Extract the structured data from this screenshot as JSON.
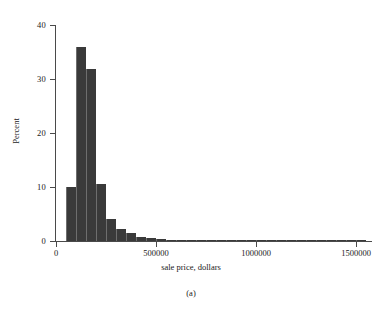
{
  "caption": "(a)",
  "chart_data": {
    "type": "bar",
    "subtype": "histogram",
    "title": "",
    "xlabel": "sale price, dollars",
    "ylabel": "Percent",
    "xlim": [
      0,
      1580000
    ],
    "ylim": [
      0,
      40
    ],
    "xticks": [
      0,
      500000,
      1000000,
      1500000
    ],
    "xtick_labels": [
      "0",
      "500000",
      "1000000",
      "1500000"
    ],
    "yticks": [
      0,
      10,
      20,
      30,
      40
    ],
    "ytick_labels": [
      "0",
      "10",
      "20",
      "30",
      "40"
    ],
    "grid": false,
    "legend": null,
    "bin_width": 50000,
    "bar_color": "#3a3a3a",
    "axis_color": "#4a4a4a",
    "bin_starts": [
      50000,
      100000,
      150000,
      200000,
      250000,
      300000,
      350000,
      400000,
      450000,
      500000,
      550000,
      600000,
      650000,
      700000,
      750000,
      800000,
      850000,
      900000,
      950000,
      1000000,
      1050000,
      1100000,
      1150000,
      1200000,
      1250000,
      1300000,
      1350000,
      1400000,
      1450000,
      1500000
    ],
    "values": [
      10.0,
      36.0,
      31.8,
      10.6,
      4.0,
      2.3,
      1.4,
      0.7,
      0.5,
      0.35,
      0.25,
      0.2,
      0.18,
      0.14,
      0.1,
      0.1,
      0.08,
      0.07,
      0.06,
      0.05,
      0.05,
      0.04,
      0.04,
      0.04,
      0.03,
      0.03,
      0.03,
      0.03,
      0.03,
      0.25
    ]
  }
}
